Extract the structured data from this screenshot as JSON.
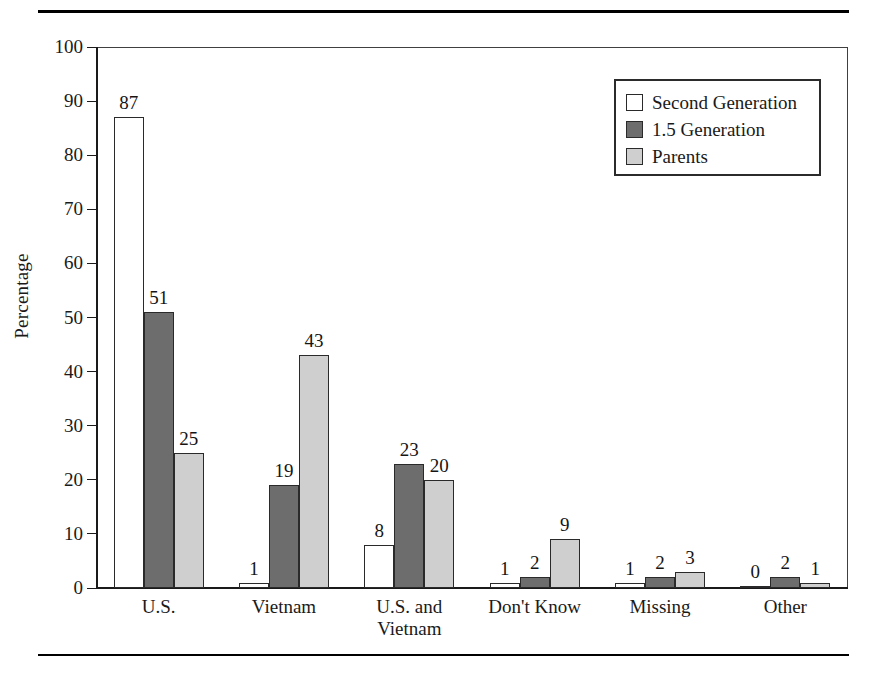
{
  "chart_data": {
    "type": "bar",
    "title": "",
    "xlabel": "",
    "ylabel": "Percentage",
    "ylim": [
      0,
      100
    ],
    "ytick_step": 10,
    "yticks": [
      0,
      10,
      20,
      30,
      40,
      50,
      60,
      70,
      80,
      90,
      100
    ],
    "grid": false,
    "legend_position": "top-right",
    "categories": [
      "U.S.",
      "Vietnam",
      "U.S. and\nVietnam",
      "Don't Know",
      "Missing",
      "Other"
    ],
    "series": [
      {
        "name": "Second Generation",
        "color": "#ffffff",
        "values": [
          87,
          1,
          8,
          1,
          1,
          0
        ]
      },
      {
        "name": "1.5 Generation",
        "color": "#6d6d6d",
        "values": [
          51,
          19,
          23,
          2,
          2,
          2
        ]
      },
      {
        "name": "Parents",
        "color": "#cfcfcf",
        "values": [
          25,
          43,
          20,
          9,
          3,
          1
        ]
      }
    ]
  },
  "legend": {
    "items": [
      {
        "label": "Second Generation",
        "swatch": "s0"
      },
      {
        "label": "1.5 Generation",
        "swatch": "s1"
      },
      {
        "label": "Parents",
        "swatch": "s2"
      }
    ]
  },
  "colors": {
    "second_generation": "#ffffff",
    "generation_1_5": "#6d6d6d",
    "parents": "#cfcfcf",
    "ink": "#1a1a1a",
    "frame": "#404040"
  }
}
